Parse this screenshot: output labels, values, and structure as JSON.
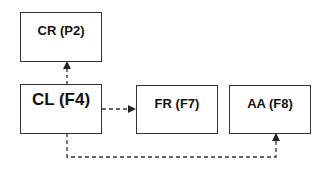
{
  "diagram": {
    "nodes": [
      {
        "id": "cr",
        "label": "CR (P2)"
      },
      {
        "id": "cl",
        "label": "CL (F4)"
      },
      {
        "id": "fr",
        "label": "FR (F7)"
      },
      {
        "id": "aa",
        "label": "AA (F8)"
      }
    ],
    "edges": [
      {
        "from": "cl",
        "to": "cr",
        "style": "dashed"
      },
      {
        "from": "cl",
        "to": "fr",
        "style": "dashed"
      },
      {
        "from": "cl",
        "to": "aa",
        "style": "dashed"
      }
    ]
  }
}
